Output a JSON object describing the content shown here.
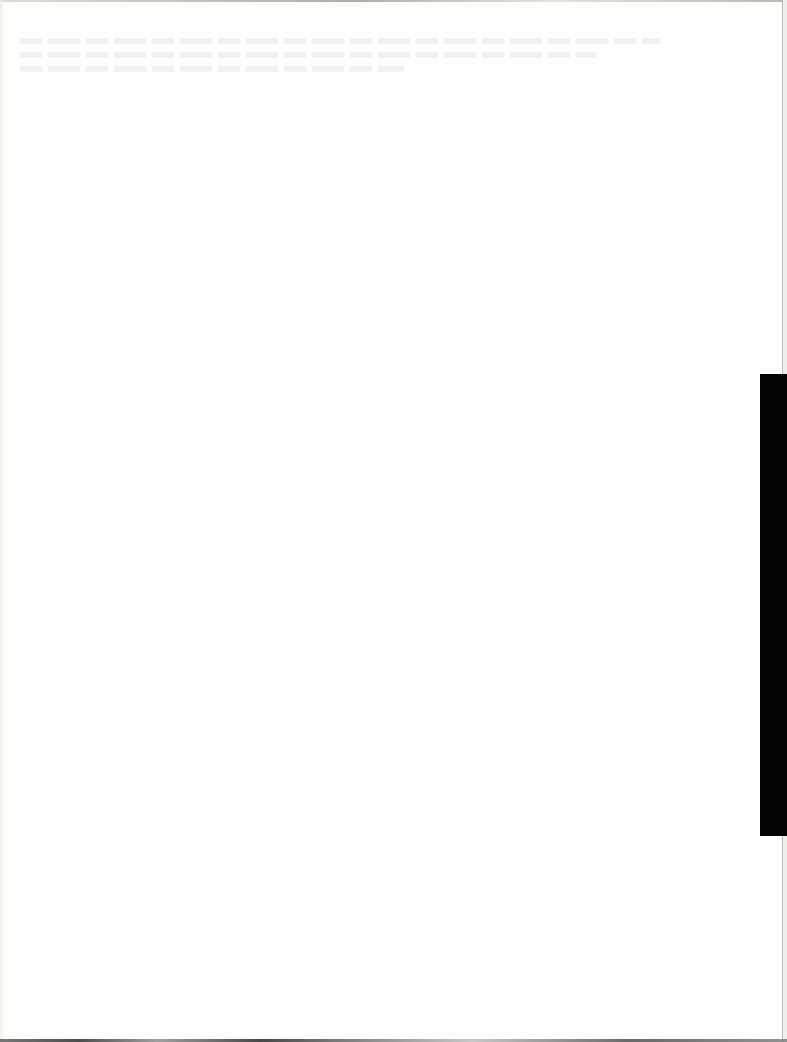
{
  "document": {
    "type": "scanned blank page",
    "content_text": "",
    "colors": {
      "page": "#fefefc",
      "tab": "#050505",
      "edge_rule": "#bdbdb8"
    }
  }
}
